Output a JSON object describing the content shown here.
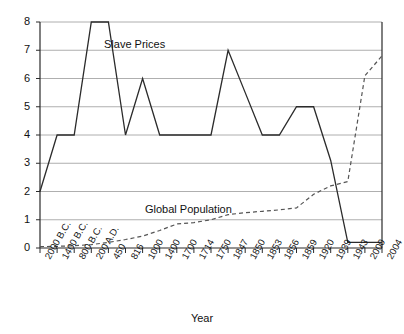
{
  "chart_data": {
    "type": "line",
    "title": "",
    "xlabel": "Year",
    "ylabel": "",
    "ylim": [
      0,
      8
    ],
    "yticks": [
      0,
      1,
      2,
      3,
      4,
      5,
      6,
      7,
      8
    ],
    "grid": true,
    "legend_position": "inline-annotations",
    "categories": [
      "2000 B.C.",
      "1400 B.C.",
      "800 B.C.",
      "200 A.D.",
      "450",
      "816",
      "1000",
      "1400",
      "1700",
      "1714",
      "1750",
      "1847",
      "1850",
      "1853",
      "1856",
      "1859",
      "1920",
      "1939",
      "1943",
      "2000",
      "2004"
    ],
    "series": [
      {
        "name": "Slave Prices",
        "style": "solid",
        "color": "#2b2b2b",
        "values": [
          2,
          4,
          4,
          8,
          8,
          4,
          6,
          4,
          4,
          4,
          4,
          7,
          5.5,
          4,
          4,
          5,
          5,
          3.1,
          0.2,
          0.2,
          0.2
        ]
      },
      {
        "name": "Global Population",
        "style": "dashed",
        "color": "#555555",
        "values": [
          0.05,
          0.06,
          0.08,
          0.12,
          0.2,
          0.3,
          0.42,
          0.62,
          0.85,
          0.9,
          1.0,
          1.18,
          1.25,
          1.3,
          1.35,
          1.42,
          1.9,
          2.2,
          2.35,
          6.1,
          6.8
        ]
      }
    ],
    "annotations": [
      {
        "text": "Slave Prices",
        "x_px": 104,
        "y_px": 38
      },
      {
        "text": "Global Population",
        "x_px": 145,
        "y_px": 203
      }
    ]
  },
  "axis": {
    "y_tick_labels": [
      "8",
      "7",
      "6",
      "5",
      "4",
      "3",
      "2",
      "1",
      "0"
    ],
    "x_title": "Year"
  }
}
